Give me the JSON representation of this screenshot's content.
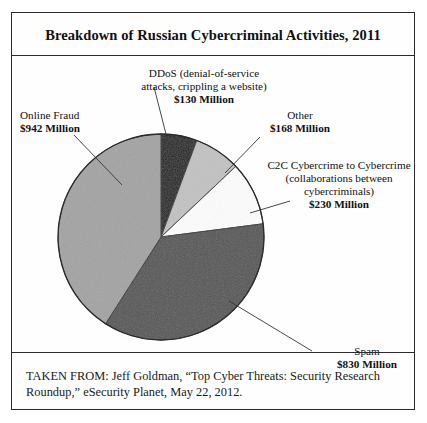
{
  "figure": {
    "title": "Breakdown of Russian Cybercriminal Activities, 2011",
    "source": "TAKEN FROM: Jeff Goldman, “Top Cyber Threats: Security Research Roundup,” eSecurity Planet, May 22, 2012."
  },
  "labels": {
    "ddos": {
      "name": "DDoS (denial-of-service",
      "name2": "attacks, crippling a website)",
      "value": "$130 Million"
    },
    "fraud": {
      "name": "Online Fraud",
      "value": "$942 Million"
    },
    "other": {
      "name": "Other",
      "value": "$168 Million"
    },
    "c2c": {
      "name": "C2C Cybercrime to Cybercrime",
      "name2": "(collaborations between",
      "name3": "cybercriminals)",
      "value": "$230 Million"
    },
    "spam": {
      "name": "Spam",
      "value": "$830 Million"
    }
  },
  "chart_data": {
    "type": "pie",
    "title": "Breakdown of Russian Cybercriminal Activities, 2011",
    "unit": "Millions of US dollars",
    "categories": [
      "DDoS (denial-of-service attacks, crippling a website)",
      "Other",
      "C2C Cybercrime to Cybercrime (collaborations between cybercriminals)",
      "Spam",
      "Online Fraud"
    ],
    "values": [
      130,
      168,
      230,
      830,
      942
    ],
    "value_labels": [
      "$130 Million",
      "$168 Million",
      "$230 Million",
      "$830 Million",
      "$942 Million"
    ],
    "colors": [
      "#1e1e1e",
      "#c2c2c2",
      "#fdfdfd",
      "#555555",
      "#a3a3a3"
    ],
    "start_angle_deg": 0,
    "direction": "clockwise",
    "total": 2300,
    "legend": "none",
    "labels_position": "outside-with-leader-lines"
  },
  "geometry": {
    "cx": 149,
    "cy": 224,
    "r": 103
  }
}
